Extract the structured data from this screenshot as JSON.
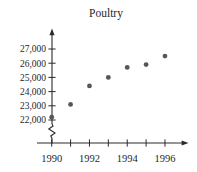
{
  "chart_data": {
    "type": "scatter",
    "title": "Poultry",
    "xlabel": "",
    "ylabel": "",
    "x": [
      1990,
      1991,
      1992,
      1993,
      1994,
      1995,
      1996
    ],
    "values": [
      22200,
      23100,
      24400,
      25000,
      25700,
      25900,
      26500
    ],
    "x_ticks": [
      {
        "v": 1990,
        "label": "1990"
      },
      {
        "v": 1991,
        "label": ""
      },
      {
        "v": 1992,
        "label": "1992"
      },
      {
        "v": 1993,
        "label": ""
      },
      {
        "v": 1994,
        "label": "1994"
      },
      {
        "v": 1995,
        "label": ""
      },
      {
        "v": 1996,
        "label": "1996"
      }
    ],
    "y_ticks": [
      {
        "v": 22000,
        "label": "22,000"
      },
      {
        "v": 23000,
        "label": "23,000"
      },
      {
        "v": 24000,
        "label": "24,000"
      },
      {
        "v": 25000,
        "label": "25,000"
      },
      {
        "v": 26000,
        "label": "26,000"
      },
      {
        "v": 27000,
        "label": "27,000"
      }
    ],
    "xlim": [
      1990,
      1996
    ],
    "ylim": [
      22000,
      27000
    ],
    "axis_break_on_y_axis": true,
    "grid": false,
    "legend": "none",
    "point_color": "#565656",
    "axis_color": "#2a2a2a",
    "background": "#ffffff"
  }
}
